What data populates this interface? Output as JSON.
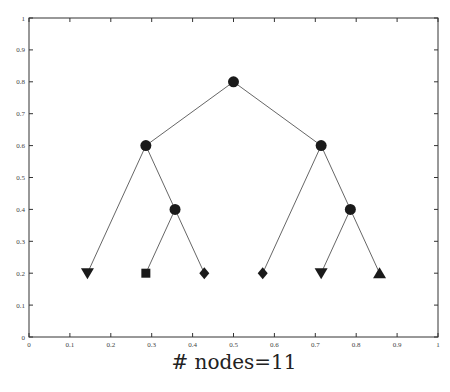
{
  "chart_data": {
    "type": "scatter",
    "subtype": "tree-diagram",
    "title": "",
    "xlabel": "# nodes=11",
    "ylabel": "",
    "xlim": [
      0,
      1
    ],
    "ylim": [
      0,
      1
    ],
    "grid": false,
    "x_ticks": [
      "0",
      "0.1",
      "0.2",
      "0.3",
      "0.4",
      "0.5",
      "0.6",
      "0.7",
      "0.8",
      "0.9",
      "1"
    ],
    "y_ticks": [
      "0",
      "0.1",
      "0.2",
      "0.3",
      "0.4",
      "0.5",
      "0.6",
      "0.7",
      "0.8",
      "0.9",
      "1"
    ],
    "nodes": [
      {
        "id": 0,
        "x": 0.5,
        "y": 0.8,
        "marker": "circle"
      },
      {
        "id": 1,
        "x": 0.2857,
        "y": 0.6,
        "marker": "circle"
      },
      {
        "id": 2,
        "x": 0.7143,
        "y": 0.6,
        "marker": "circle"
      },
      {
        "id": 3,
        "x": 0.1429,
        "y": 0.2,
        "marker": "triangle-down"
      },
      {
        "id": 4,
        "x": 0.3571,
        "y": 0.4,
        "marker": "circle"
      },
      {
        "id": 5,
        "x": 0.5714,
        "y": 0.2,
        "marker": "diamond"
      },
      {
        "id": 6,
        "x": 0.7857,
        "y": 0.4,
        "marker": "circle"
      },
      {
        "id": 7,
        "x": 0.2857,
        "y": 0.2,
        "marker": "square"
      },
      {
        "id": 8,
        "x": 0.4286,
        "y": 0.2,
        "marker": "diamond"
      },
      {
        "id": 9,
        "x": 0.7143,
        "y": 0.2,
        "marker": "triangle-down"
      },
      {
        "id": 10,
        "x": 0.8571,
        "y": 0.2,
        "marker": "triangle-up"
      }
    ],
    "edges": [
      [
        0,
        1
      ],
      [
        0,
        2
      ],
      [
        1,
        3
      ],
      [
        1,
        4
      ],
      [
        2,
        5
      ],
      [
        2,
        6
      ],
      [
        4,
        7
      ],
      [
        4,
        8
      ],
      [
        6,
        9
      ],
      [
        6,
        10
      ]
    ],
    "colors": {
      "marker": "#1a1a1a",
      "edge": "#555555",
      "axis": "#333333"
    }
  }
}
